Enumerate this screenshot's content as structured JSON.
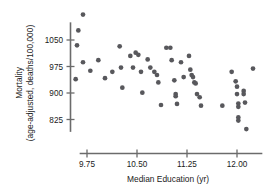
{
  "chart_data": {
    "type": "scatter",
    "title": "",
    "xlabel": "Median Education (yr)",
    "ylabel_line1": "Mortality",
    "ylabel_line2": "(age-adjusted, deaths/100,000)",
    "xticks": [
      "9.75",
      "10.50",
      "11.25",
      "12.00"
    ],
    "xtick_values": [
      9.75,
      10.5,
      11.25,
      12.0
    ],
    "yticks": [
      "1050",
      "975",
      "900",
      "825"
    ],
    "ytick_values": [
      1050,
      975,
      900,
      825
    ],
    "xlim": [
      9.6,
      12.35
    ],
    "ylim": [
      790,
      1100
    ],
    "grid": false,
    "legend": null,
    "marker_color": "#58585c",
    "axis_color": "#6b6b6b",
    "points": [
      {
        "x": 9.69,
        "y": 1122
      },
      {
        "x": 9.62,
        "y": 1077
      },
      {
        "x": 9.6,
        "y": 1035
      },
      {
        "x": 9.58,
        "y": 939
      },
      {
        "x": 9.69,
        "y": 987
      },
      {
        "x": 9.8,
        "y": 963
      },
      {
        "x": 9.92,
        "y": 993
      },
      {
        "x": 10.02,
        "y": 942
      },
      {
        "x": 10.13,
        "y": 960
      },
      {
        "x": 10.24,
        "y": 1032
      },
      {
        "x": 10.26,
        "y": 972
      },
      {
        "x": 10.28,
        "y": 915
      },
      {
        "x": 10.4,
        "y": 1005
      },
      {
        "x": 10.44,
        "y": 972
      },
      {
        "x": 10.48,
        "y": 1014
      },
      {
        "x": 10.52,
        "y": 1008
      },
      {
        "x": 10.56,
        "y": 960
      },
      {
        "x": 10.58,
        "y": 901
      },
      {
        "x": 10.66,
        "y": 995
      },
      {
        "x": 10.7,
        "y": 972
      },
      {
        "x": 10.76,
        "y": 960
      },
      {
        "x": 10.8,
        "y": 951
      },
      {
        "x": 10.82,
        "y": 930
      },
      {
        "x": 10.86,
        "y": 866
      },
      {
        "x": 10.94,
        "y": 1028
      },
      {
        "x": 11.0,
        "y": 1028
      },
      {
        "x": 11.02,
        "y": 993
      },
      {
        "x": 11.06,
        "y": 936
      },
      {
        "x": 11.08,
        "y": 897
      },
      {
        "x": 11.08,
        "y": 891
      },
      {
        "x": 11.1,
        "y": 869
      },
      {
        "x": 11.16,
        "y": 987
      },
      {
        "x": 11.2,
        "y": 945
      },
      {
        "x": 11.28,
        "y": 1005
      },
      {
        "x": 11.3,
        "y": 966
      },
      {
        "x": 11.32,
        "y": 951
      },
      {
        "x": 11.34,
        "y": 945
      },
      {
        "x": 11.36,
        "y": 930
      },
      {
        "x": 11.38,
        "y": 927
      },
      {
        "x": 11.4,
        "y": 897
      },
      {
        "x": 11.44,
        "y": 888
      },
      {
        "x": 11.46,
        "y": 864
      },
      {
        "x": 11.78,
        "y": 864
      },
      {
        "x": 11.92,
        "y": 960
      },
      {
        "x": 11.98,
        "y": 933
      },
      {
        "x": 12.0,
        "y": 918
      },
      {
        "x": 12.0,
        "y": 897
      },
      {
        "x": 12.02,
        "y": 870
      },
      {
        "x": 12.02,
        "y": 861
      },
      {
        "x": 12.02,
        "y": 831
      },
      {
        "x": 12.02,
        "y": 822
      },
      {
        "x": 12.1,
        "y": 906
      },
      {
        "x": 12.1,
        "y": 897
      },
      {
        "x": 12.12,
        "y": 873
      },
      {
        "x": 12.14,
        "y": 798
      },
      {
        "x": 12.24,
        "y": 969
      }
    ]
  }
}
